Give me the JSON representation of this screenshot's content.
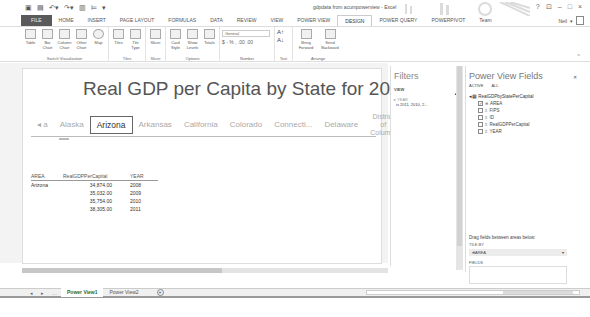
{
  "window": {
    "title": "gdpdata from acumpowerview - Excel",
    "controls": [
      "?",
      "⊡",
      "–",
      "□",
      "×"
    ]
  },
  "ribbon_tabs": [
    "FILE",
    "HOME",
    "INSERT",
    "PAGE LAYOUT",
    "FORMULAS",
    "DATA",
    "REVIEW",
    "VIEW",
    "POWER VIEW",
    "DESIGN",
    "POWER QUERY",
    "POWERPIVOT",
    "Team"
  ],
  "active_tab": "DESIGN",
  "user": "Neil",
  "ribbon_groups": [
    {
      "label": "Switch Visualization",
      "buttons": [
        "Table",
        "Bar Chart",
        "Column Chart",
        "Other Chart",
        "Map"
      ]
    },
    {
      "label": "Tiles",
      "buttons": [
        "Tiles",
        "Tile Type"
      ]
    },
    {
      "label": "Slicer",
      "buttons": [
        "Slicer"
      ]
    },
    {
      "label": "Options",
      "buttons": [
        "Card Style",
        "Show Levels",
        "Totals"
      ]
    },
    {
      "label": "Number",
      "select": "General",
      "row": "$ - % , .00 .00"
    },
    {
      "label": "Text",
      "buttons": [
        "A↑",
        "A↓"
      ]
    },
    {
      "label": "Arrange",
      "buttons": [
        "Bring Forward",
        "Send Backward"
      ]
    }
  ],
  "report": {
    "title": "Real GDP per Capita by State for 2008-2011",
    "tiles": [
      "◂ a",
      "Alaska",
      "Arizona",
      "Arkansas",
      "California",
      "Colorado",
      "Connecti...",
      "Delaware",
      "District of Colum...",
      "For W ▸"
    ],
    "selected_tile": "Arizona",
    "table": {
      "headers": [
        "AREA",
        "RealGDPPerCapital",
        "YEAR"
      ],
      "rows": [
        [
          "Arizona",
          "34,874.00",
          "2008"
        ],
        [
          "",
          "35,032.00",
          "2009"
        ],
        [
          "",
          "35,754.00",
          "2010"
        ],
        [
          "",
          "38,305.00",
          "2011"
        ]
      ]
    }
  },
  "filters": {
    "title": "Filters",
    "view_label": "VIEW",
    "field": "YEAR",
    "field_value": "is 2011, 2010, 2..."
  },
  "fields_pane": {
    "title": "Power View Fields",
    "tabs": [
      "ACTIVE",
      "ALL"
    ],
    "table_name": "RealGDPbyStatePerCapital",
    "fields": [
      {
        "name": "AREA",
        "checked": true,
        "sigma": false
      },
      {
        "name": "FIPS",
        "checked": false,
        "sigma": true
      },
      {
        "name": "ID",
        "checked": false,
        "sigma": true
      },
      {
        "name": "RealGDPPerCapital",
        "checked": false,
        "sigma": true
      },
      {
        "name": "YEAR",
        "checked": false,
        "sigma": true
      }
    ],
    "drag_hint": "Drag fields between areas below:",
    "tile_by_label": "TILE BY",
    "tile_by_value": "AREA",
    "fields_label": "FIELDS"
  },
  "sheets": {
    "tabs": [
      "Power View1",
      "Power View2"
    ],
    "active": "Power View1",
    "add": "+"
  }
}
